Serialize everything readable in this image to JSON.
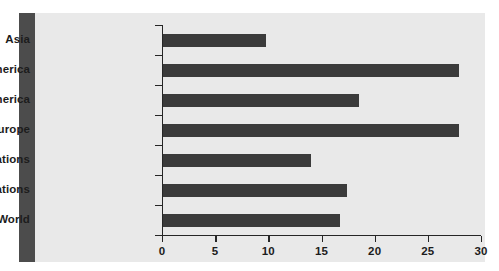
{
  "figure": {
    "background_color": "#e9e9e9",
    "accent_band_color": "#4c4c4c",
    "bar_color": "#3b3b3b",
    "axis_color": "#262626"
  },
  "chart_data": {
    "type": "bar",
    "orientation": "horizontal",
    "title": "",
    "subtitle": "",
    "xlabel": "",
    "ylabel": "",
    "categories": [
      "Asia",
      "Latin America",
      "North America",
      "Western Europe",
      "Developing Nations",
      "Developed Nations",
      "World"
    ],
    "values": [
      9.7,
      27.8,
      18.4,
      27.8,
      13.9,
      17.3,
      16.6
    ],
    "xlim": [
      0,
      30
    ],
    "xticks": [
      0,
      5,
      10,
      15,
      20,
      25,
      30
    ],
    "xticklabels": [
      "0",
      "5",
      "10",
      "15",
      "20",
      "25",
      "30"
    ],
    "grid": false,
    "legend": null,
    "annotations": []
  }
}
